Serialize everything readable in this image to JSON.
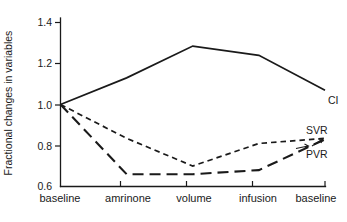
{
  "chart_data": {
    "type": "line",
    "title": "",
    "xlabel": "",
    "ylabel": "Fractional changes in variables",
    "categories": [
      "baseline",
      "amrinone",
      "volume",
      "infusion",
      "baseline"
    ],
    "ylim": [
      0.6,
      1.4
    ],
    "yticks": [
      "0.6",
      "0.8",
      "1.0",
      "1.2",
      "1.4"
    ],
    "ytick_values": [
      0.6,
      0.8,
      1.0,
      1.2,
      1.4
    ],
    "grid": false,
    "legend_position": "right-inline",
    "series": [
      {
        "name": "CI",
        "style": "solid",
        "values": [
          1.0,
          1.13,
          1.285,
          1.24,
          1.07
        ]
      },
      {
        "name": "SVR",
        "style": "short-dashed",
        "values": [
          1.0,
          0.835,
          0.7,
          0.81,
          0.835
        ]
      },
      {
        "name": "PVR",
        "style": "long-dashed",
        "values": [
          1.0,
          0.66,
          0.66,
          0.68,
          0.83
        ]
      }
    ]
  },
  "labels": {
    "y_axis_title": "Fractional changes in variables",
    "ytick_0": "0.6",
    "ytick_1": "0.8",
    "ytick_2": "1.0",
    "ytick_3": "1.2",
    "ytick_4": "1.4",
    "xtick_0": "baseline",
    "xtick_1": "amrinone",
    "xtick_2": "volume",
    "xtick_3": "infusion",
    "xtick_4": "baseline",
    "series_ci": "CI",
    "series_svr": "SVR",
    "series_pvr": "PVR"
  },
  "colors": {
    "ink": "#1a1a1a",
    "background": "#ffffff"
  }
}
